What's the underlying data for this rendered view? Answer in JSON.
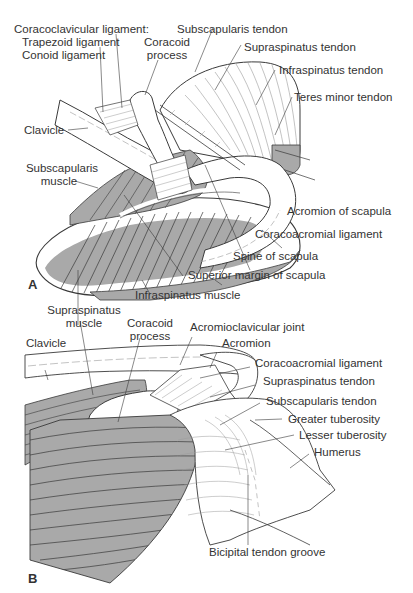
{
  "figure": {
    "colors": {
      "muscle_fill": "#a9a9a9",
      "line": "#3a3a3a",
      "light_line": "#9a9a9a",
      "background": "#ffffff"
    },
    "panels": [
      {
        "letter": "A",
        "labels": {
          "coracoclavicular": "Coracoclavicular ligament:",
          "trapezoid": "Trapezoid ligament",
          "conoid": "Conoid ligament",
          "coracoid_1": "Coracoid",
          "coracoid_2": "process",
          "subscapularis_tendon": "Subscapularis tendon",
          "supraspinatus_tendon": "Supraspinatus tendon",
          "infraspinatus_tendon": "Infraspinatus tendon",
          "teres_minor_tendon": "Teres minor tendon",
          "clavicle": "Clavicle",
          "subscapularis_muscle_1": "Subscapularis",
          "subscapularis_muscle_2": "muscle",
          "acromion_of_scapula": "Acromion of scapula",
          "coracoacromial_ligament": "Coracoacromial ligament",
          "spine_of_scapula": "Spine of scapula",
          "superior_margin": "Superior margin of scapula",
          "infraspinatus_muscle": "Infraspinatus muscle"
        }
      },
      {
        "letter": "B",
        "labels": {
          "supraspinatus_muscle_1": "Supraspinatus",
          "supraspinatus_muscle_2": "muscle",
          "coracoid_1": "Coracoid",
          "coracoid_2": "process",
          "acromioclavicular_joint": "Acromioclavicular joint",
          "acromion": "Acromion",
          "clavicle": "Clavicle",
          "coracoacromial_ligament": "Coracoacromial ligament",
          "supraspinatus_tendon": "Supraspinatus tendon",
          "subscapularis_tendon": "Subscapularis tendon",
          "greater_tuberosity": "Greater tuberosity",
          "lesser_tuberosity": "Lesser tuberosity",
          "humerus": "Humerus",
          "bicipital_groove": "Bicipital tendon groove"
        }
      }
    ]
  }
}
